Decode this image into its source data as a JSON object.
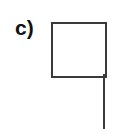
{
  "figure": {
    "label": "c)",
    "shape": "flag",
    "stroke_color": "#3a3a3a",
    "label_color": "#111111"
  }
}
